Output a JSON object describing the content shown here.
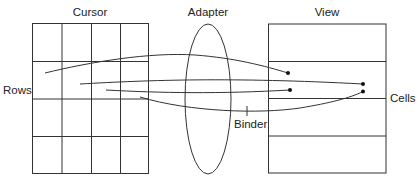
{
  "diagram": {
    "labels": {
      "cursor": "Cursor",
      "adapter": "Adapter",
      "view": "View",
      "rows": "Rows",
      "cells": "Cells",
      "binder": "Binder"
    },
    "cursor_grid": {
      "columns": 4,
      "rows": 4
    },
    "view_list": {
      "rows": 4
    },
    "connections": [
      {
        "from": "cursor-row-2",
        "to": "view-row-2-left"
      },
      {
        "from": "cursor-row-2",
        "to": "view-row-2-right-top"
      },
      {
        "from": "cursor-row-2",
        "to": "view-row-2-left-lower"
      },
      {
        "from": "cursor-row-2",
        "to": "view-row-2-right-bottom"
      }
    ],
    "colors": {
      "line": "#333333",
      "text": "#222222",
      "background": "#ffffff"
    }
  }
}
